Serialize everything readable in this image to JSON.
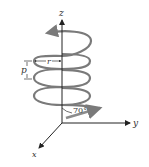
{
  "diagram": {
    "axes": {
      "z_label": "z",
      "y_label": "y",
      "x_label": "x"
    },
    "labels": {
      "radius": "r",
      "pitch": "p",
      "angle": "70°"
    },
    "colors": {
      "helix": "#7a7a7a",
      "axis": "#222222",
      "velocity_arrow": "#8c8c8c"
    }
  }
}
